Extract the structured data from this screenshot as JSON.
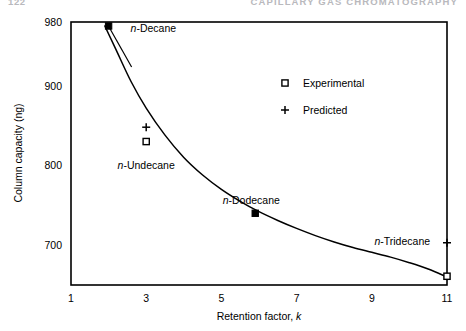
{
  "page_header": {
    "folio": "122",
    "running_head": "CAPILLARY GAS CHROMATOGRAPHY"
  },
  "chart_data": {
    "type": "scatter",
    "title": "",
    "xlabel": "Retention factor, k",
    "ylabel": "Column capacity (ng)",
    "xlim": [
      1,
      11
    ],
    "ylim": [
      650,
      980
    ],
    "xticks": [
      1,
      3,
      5,
      7,
      9,
      11
    ],
    "xtick_labels": [
      "1",
      "3",
      "5",
      "7",
      "9",
      "11"
    ],
    "yticks": [
      700,
      800,
      900,
      980
    ],
    "ytick_labels": [
      "700",
      "800",
      "900",
      "980"
    ],
    "grid": false,
    "frame": true,
    "legend": {
      "position": "upper-center-right",
      "entries": [
        {
          "label": "Experimental",
          "marker": "open-square"
        },
        {
          "label": "Predicted",
          "marker": "plus"
        }
      ]
    },
    "series": [
      {
        "name": "Fitted curve",
        "type": "line",
        "marker": "none",
        "x": [
          1.9,
          2.2,
          2.6,
          3.0,
          3.5,
          4.0,
          4.5,
          5.0,
          5.5,
          6.0,
          6.5,
          7.0,
          7.5,
          8.0,
          8.5,
          9.0,
          9.5,
          10.0,
          10.5,
          11.0
        ],
        "y": [
          975,
          945,
          905,
          872,
          838,
          810,
          788,
          770,
          755,
          742,
          731,
          721,
          712,
          704,
          697,
          691,
          685,
          678,
          670,
          660
        ]
      },
      {
        "name": "Measured points",
        "type": "scatter",
        "marker": "filled-square",
        "points": [
          {
            "label": "n-Decane",
            "x": 2.0,
            "y": 975,
            "label_dx": 22,
            "label_dy": 6,
            "leader": true
          },
          {
            "label": "n-Dodecane",
            "x": 5.9,
            "y": 740,
            "label_dx": -4,
            "label_dy": -9,
            "leader": false
          }
        ]
      },
      {
        "name": "Predicted",
        "type": "scatter",
        "marker": "plus",
        "points": [
          {
            "x": 3.0,
            "y": 848
          },
          {
            "x": 11.0,
            "y": 703
          }
        ]
      },
      {
        "name": "Experimental",
        "type": "scatter",
        "marker": "open-square",
        "points": [
          {
            "x": 3.0,
            "y": 830
          },
          {
            "x": 11.0,
            "y": 661
          }
        ]
      }
    ],
    "annotations": [
      {
        "label": "n-Undecane",
        "x": 3.0,
        "y": 795,
        "anchor": "middle",
        "dx": 0,
        "dy": 0
      },
      {
        "label": "n-Tridecane",
        "x": 10.55,
        "y": 700,
        "anchor": "end",
        "dx": 0,
        "dy": 0
      }
    ]
  }
}
